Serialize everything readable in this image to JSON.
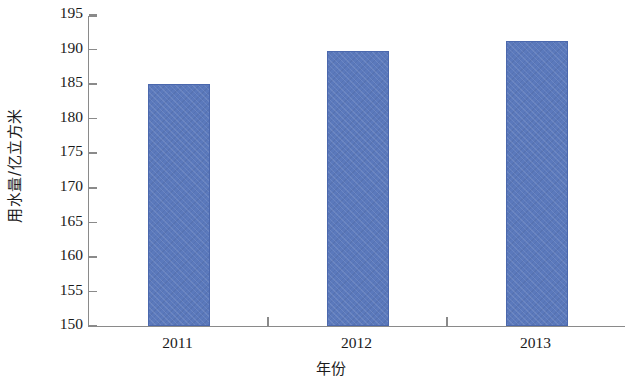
{
  "chart_data": {
    "type": "bar",
    "title": "",
    "subtitle": "",
    "categories": [
      "2011",
      "2012",
      "2013"
    ],
    "values": [
      185.0,
      189.8,
      191.2
    ],
    "series": [
      {
        "name": "用水量",
        "values": [
          185.0,
          189.8,
          191.2
        ]
      }
    ],
    "xlabel": "年份",
    "ylabel": "用水量/亿立方米",
    "ylim": [
      150,
      195
    ],
    "y_ticks": [
      150,
      155,
      160,
      165,
      170,
      175,
      180,
      185,
      190,
      195
    ],
    "y_tick_labels": [
      "150",
      "155",
      "160",
      "165",
      "170",
      "175",
      "180",
      "185",
      "190",
      "195"
    ],
    "x_tick_labels": [
      "2011",
      "2012",
      "2013"
    ],
    "grid": false,
    "legend": false,
    "legend_position": "none",
    "bar_color": "#5b79bc",
    "bar_edge_color": "#4b68ad",
    "axis_color": "#8a8a8a",
    "background_color": "#ffffff",
    "annotations": []
  },
  "axes": {
    "y_title": "用水量/亿立方米",
    "x_title": "年份"
  }
}
